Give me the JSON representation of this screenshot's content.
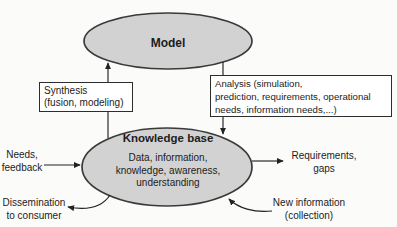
{
  "colors": {
    "background": "#fbfbfa",
    "ellipse_fill": "#d2d2d2",
    "ellipse_stroke": "#3a3a3a",
    "line": "#222222",
    "text": "#1c1c1c"
  },
  "model": {
    "label": "Model"
  },
  "knowledge_base": {
    "title": "Knowledge base",
    "contents": "Data, information,\nknowledge, awareness,\nunderstanding"
  },
  "process_boxes": {
    "synthesis": "Synthesis\n(fusion, modeling)",
    "analysis": "Analysis (simulation,\nprediction, requirements, operational\nneeds, information needs,...)"
  },
  "flows": {
    "input_left": "Needs,\nfeedback",
    "output_right": "Requirements,\ngaps",
    "output_bottom_left": "Dissemination\nto consumer",
    "input_bottom_right": "New information\n(collection)"
  }
}
